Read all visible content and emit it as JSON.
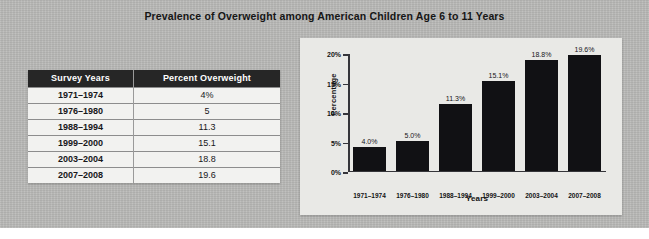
{
  "title": "Prevalence of Overweight among American Children Age 6 to 11 Years",
  "table": {
    "headers": [
      "Survey Years",
      "Percent Overweight"
    ],
    "rows": [
      {
        "years": "1971–1974",
        "percent": "4%"
      },
      {
        "years": "1976–1980",
        "percent": "5"
      },
      {
        "years": "1988–1994",
        "percent": "11.3"
      },
      {
        "years": "1999–2000",
        "percent": "15.1"
      },
      {
        "years": "2003–2004",
        "percent": "18.8"
      },
      {
        "years": "2007–2008",
        "percent": "19.6"
      }
    ]
  },
  "chart_data": {
    "type": "bar",
    "title": "",
    "xlabel": "Years",
    "ylabel": "Percentage",
    "categories": [
      "1971–1974",
      "1976–1980",
      "1988–1994",
      "1999–2000",
      "2003–2004",
      "2007–2008"
    ],
    "values": [
      4.0,
      5.0,
      11.3,
      15.1,
      18.8,
      19.6
    ],
    "data_labels": [
      "4.0%",
      "5.0%",
      "11.3%",
      "15.1%",
      "18.8%",
      "19.6%"
    ],
    "ylim": [
      0,
      20
    ],
    "ytick_labels": [
      "0%",
      "5%",
      "10%",
      "15%",
      "20%"
    ],
    "ytick_values": [
      0,
      5,
      10,
      15,
      20
    ],
    "grid": false,
    "legend": false,
    "bar_color": "#111114",
    "panel_color": "#e9e9e6"
  }
}
